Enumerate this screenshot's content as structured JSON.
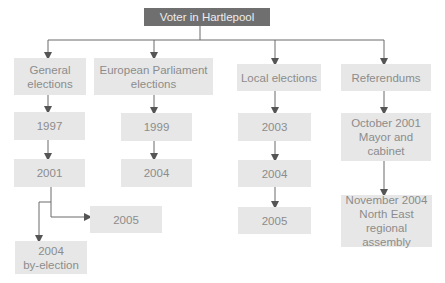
{
  "root": {
    "label": "Voter in Hartlepool"
  },
  "categories": [
    {
      "label": "General\nelections",
      "children": [
        {
          "label": "1997"
        },
        {
          "label": "2001"
        },
        {
          "label": "2005"
        },
        {
          "label": "2004\nby-election"
        }
      ]
    },
    {
      "label": "European Parliament\nelections",
      "children": [
        {
          "label": "1999"
        },
        {
          "label": "2004"
        }
      ]
    },
    {
      "label": "Local elections",
      "children": [
        {
          "label": "2003"
        },
        {
          "label": "2004"
        },
        {
          "label": "2005"
        }
      ]
    },
    {
      "label": "Referendums",
      "children": [
        {
          "label": "October 2001\nMayor and\ncabinet"
        },
        {
          "label": "November 2004\nNorth East\nregional assembly"
        }
      ]
    }
  ],
  "colors": {
    "header_bg": "#6f6f6f",
    "header_text": "#ececec",
    "box_bg": "#e7e7e7",
    "box_text": "#8c8c8c",
    "line": "#5a5a5a"
  }
}
